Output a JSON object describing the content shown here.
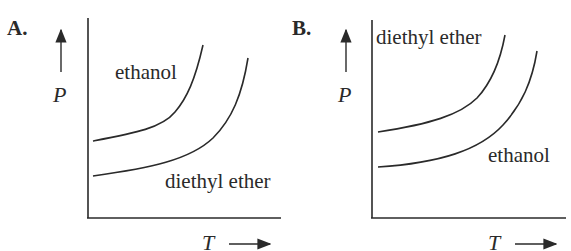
{
  "panels": [
    {
      "id": "A",
      "letter": "A.",
      "y_axis_label": "P",
      "x_axis_label": "T",
      "curves": [
        {
          "name": "ethanol",
          "position": "upper",
          "label": "ethanol"
        },
        {
          "name": "diethyl ether",
          "position": "lower",
          "label": "diethyl ether"
        }
      ]
    },
    {
      "id": "B",
      "letter": "B.",
      "y_axis_label": "P",
      "x_axis_label": "T",
      "curves": [
        {
          "name": "diethyl ether",
          "position": "upper",
          "label": "diethyl ether"
        },
        {
          "name": "ethanol",
          "position": "lower",
          "label": "ethanol"
        }
      ]
    }
  ],
  "colors": {
    "ink": "#2a2a2a",
    "background": "#ffffff"
  }
}
